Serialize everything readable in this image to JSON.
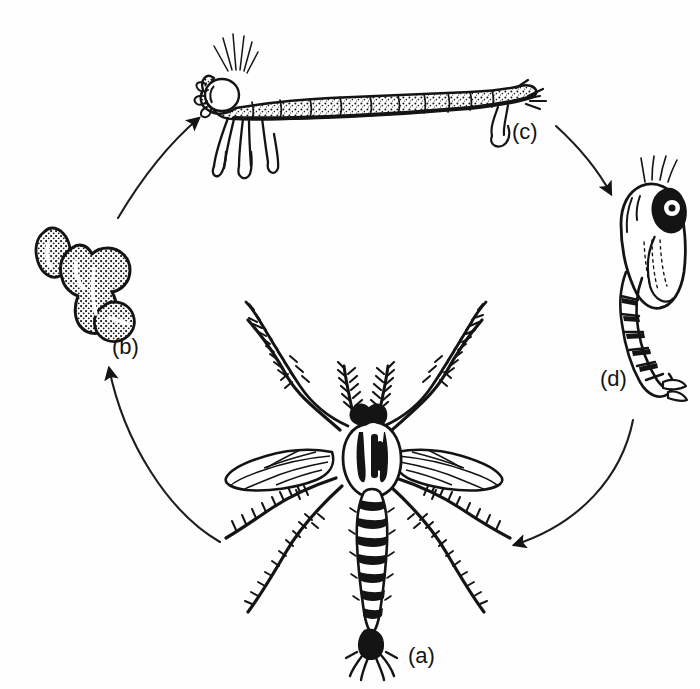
{
  "figure": {
    "background_color": "#fefefe",
    "ink_color": "#141414",
    "width": 700,
    "height": 689
  },
  "labels": {
    "adult": "(a)",
    "eggs": "(b)",
    "larva": "(c)",
    "pupa": "(d)"
  },
  "stages": [
    {
      "key": "a",
      "label": "(a)",
      "name": "adult-mosquito",
      "position": "bottom-center"
    },
    {
      "key": "b",
      "label": "(b)",
      "name": "egg-raft",
      "position": "left"
    },
    {
      "key": "c",
      "label": "(c)",
      "name": "larva",
      "position": "top"
    },
    {
      "key": "d",
      "label": "(d)",
      "name": "pupa",
      "position": "right"
    }
  ],
  "arrows": [
    {
      "from": "(b)",
      "to": "(c)",
      "direction": "up-right"
    },
    {
      "from": "(c)",
      "to": "(d)",
      "direction": "down-right"
    },
    {
      "from": "(d)",
      "to": "(a)",
      "direction": "down-left"
    },
    {
      "from": "(a)",
      "to": "(b)",
      "direction": "up-left"
    }
  ]
}
